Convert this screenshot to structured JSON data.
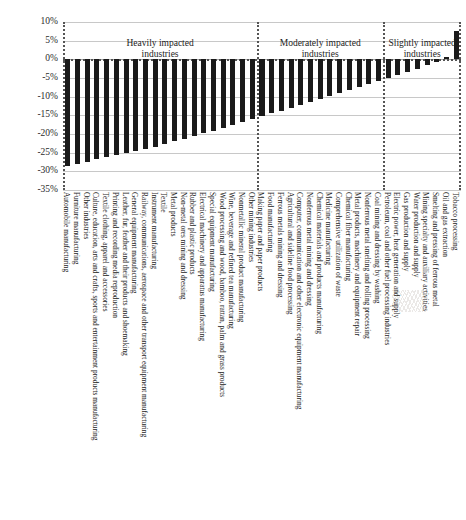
{
  "chart_data": {
    "type": "bar",
    "title": "",
    "xlabel": "",
    "ylabel": "",
    "ylim": [
      -35,
      10
    ],
    "ytick_labels": [
      "10%",
      "5%",
      "0%",
      "-5%",
      "-10%",
      "-15%",
      "-20%",
      "-25%",
      "-30%",
      "-35%"
    ],
    "ytick_values": [
      10,
      5,
      0,
      -5,
      -10,
      -15,
      -20,
      -25,
      -30,
      -35
    ],
    "grid": true,
    "legend": "none",
    "value_unit": "percent",
    "groups": [
      {
        "name": "Heavily impacted industries",
        "annotation": "Heavily impacted\nindustries",
        "categories": [
          "Automobile manufacturing",
          "Furniture manufacturing",
          "Other industries",
          "Culture, education, arts and crafts, sports and entertainment products manufacturing",
          "Textile clothing, apparel and accessories",
          "Printing and recording media reproduction",
          "Leather, fur, feather and their products and shoemaking",
          "General equipment manufacturing",
          "Railway, communications, aerospace and other transport equipment manufacturing",
          "Instrument manufacturing",
          "Textile",
          "Metal products",
          "Non-metal ores mining and dressing",
          "Rubber and plastic products",
          "Electrical machinery and apparatus manufacturing",
          "Special equipment manufacturing",
          "Wood processing and wood, bamboo, rattan, palm and grass products",
          "Wine, beverage and refined tea manufacturing",
          "Nonmetallic mineral product manufacturing",
          "Other mining industries"
        ],
        "values": [
          -28.5,
          -28.0,
          -27.4,
          -26.8,
          -26.2,
          -25.7,
          -25.2,
          -24.6,
          -24.0,
          -23.4,
          -22.7,
          -22.0,
          -21.3,
          -20.6,
          -19.8,
          -19.1,
          -18.4,
          -17.6,
          -16.8,
          -16.0
        ]
      },
      {
        "name": "Moderately impacted industries",
        "annotation": "Moderately impacted\nindustries",
        "categories": [
          "Making paper and paper products",
          "Food manufacturing",
          "Ferrous metals mining and dressing",
          "Agricultural and sideline food processing",
          "Computer, communication and other electronic equipment manufacturing",
          "Nonferrous metal mining and dressing",
          "Chemical materials and products manufacturing",
          "Medicine manufacturing",
          "Comprehensive utilization of waste",
          "Chemical fiber manufacturing",
          "Metal products, machinery and equipment repair",
          "Nonferrous metal smelting and rolling processing",
          "Coal mining and dressing by washing"
        ],
        "values": [
          -15.2,
          -14.5,
          -13.8,
          -13.0,
          -12.2,
          -11.4,
          -10.6,
          -9.7,
          -9.0,
          -8.2,
          -7.4,
          -6.6,
          -5.8
        ]
      },
      {
        "name": "Slightly impacted industries",
        "annotation": "Slightly impacted\nindustries",
        "categories": [
          "Petroleum, coal and other fuel processing industries",
          "Electric power, heat generation and supply",
          "Gas production and supply",
          "Water production and supply",
          "Mining specialty and auxiliary activities",
          "Smelting and pressing of ferrous metal",
          "Oil and gas extraction",
          "Tobacco processing"
        ],
        "values": [
          -5.0,
          -4.2,
          -3.4,
          -2.5,
          -1.6,
          -0.8,
          0.6,
          7.5
        ]
      }
    ]
  },
  "style": {
    "bar_color": "#1a1a1a",
    "gridline_color": "#c8c8c8",
    "separator_color": "#555555",
    "text_color": "#1c1c1c",
    "background": "#ffffff"
  }
}
